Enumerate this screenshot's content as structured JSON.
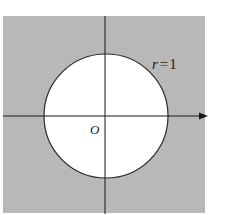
{
  "diagram": {
    "origin_label": "O",
    "circle_label": "r = 1",
    "circle_label_parts": {
      "var": "r",
      "eq": "=",
      "val": "1"
    },
    "colors": {
      "shaded_region": "#b8b8b8",
      "circle_interior": "#ffffff",
      "axes": "#1a1a1a",
      "circle_stroke": "#2a2a2a",
      "background": "#ffffff"
    }
  }
}
